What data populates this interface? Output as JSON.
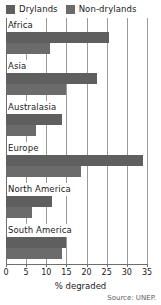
{
  "legend": {
    "position": "top-left",
    "entries": [
      {
        "label": "Drylands",
        "color": "#5f5f5f",
        "swatch_icon": "legend-swatch-icon"
      },
      {
        "label": "Non-drylands",
        "color": "#6b6b6b",
        "swatch_icon": "legend-swatch-icon"
      }
    ]
  },
  "axis": {
    "title": "% degraded",
    "ticks": [
      "0",
      "5",
      "10",
      "15",
      "20",
      "25",
      "30",
      "35"
    ]
  },
  "source": "Source: UNEP.",
  "chart_data": {
    "type": "bar",
    "orientation": "horizontal",
    "title": "",
    "subtitle": "",
    "xlabel": "% degraded",
    "ylabel": "",
    "xlim": [
      0,
      35
    ],
    "xticks": [
      0,
      5,
      10,
      15,
      20,
      25,
      30,
      35
    ],
    "grid": true,
    "legend_position": "top-left",
    "categories": [
      "Africa",
      "Asia",
      "Australasia",
      "Europe",
      "North America",
      "South America"
    ],
    "series": [
      {
        "name": "Drylands",
        "color": "#5f5f5f",
        "values": [
          25.5,
          22.5,
          14.0,
          34.0,
          11.5,
          15.0
        ]
      },
      {
        "name": "Non-drylands",
        "color": "#6b6b6b",
        "values": [
          11.0,
          15.0,
          7.5,
          18.5,
          6.5,
          14.0
        ]
      }
    ],
    "annotations": [
      "Source: UNEP."
    ]
  }
}
